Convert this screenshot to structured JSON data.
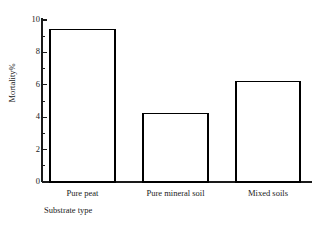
{
  "chart_data": {
    "type": "bar",
    "title": "",
    "subtitle": "",
    "categories": [
      "Pure peat",
      "Pure mineral soil",
      "Mixed soils"
    ],
    "values": [
      9.4,
      4.25,
      6.2
    ],
    "xlabel": "Substrate type",
    "ylabel": "Mortality%",
    "ylim": [
      0,
      10
    ],
    "xlim_note": "categorical",
    "y_major_ticks": [
      0,
      2,
      4,
      6,
      8,
      10
    ],
    "y_minor_ticks": [
      1,
      3,
      5,
      7,
      9
    ],
    "y_tick_labels": [
      "0",
      "2",
      "4",
      "6",
      "8",
      "10"
    ],
    "grid": false,
    "legend": null,
    "legend_position": "none",
    "bar_fill_color": "#ffffff",
    "bar_edge_color": "#000000",
    "axis_color": "#1a1a1a",
    "background_color": "#ffffff",
    "annotations": []
  },
  "axes": {
    "y_axis_name": "mortality-axis",
    "x_axis_name": "substrate-axis"
  }
}
